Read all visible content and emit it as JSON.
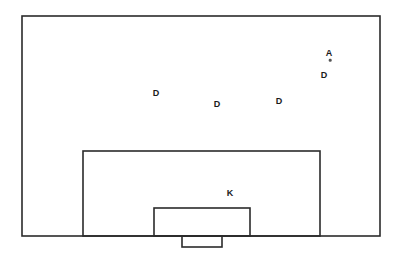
{
  "diagram": {
    "background_color": "#ffffff",
    "line_color": "#2b2b2b",
    "label_color": "#1a1a1a",
    "canvas": {
      "width": 399,
      "height": 256
    },
    "shapes": {
      "field_boundary": {
        "x": 22,
        "y": 16,
        "width": 358,
        "height": 220,
        "label": "field-boundary"
      },
      "penalty_area": {
        "x": 83,
        "y": 151,
        "width": 237,
        "height": 85,
        "label": "penalty-area"
      },
      "goal_area": {
        "x": 154,
        "y": 208,
        "width": 96,
        "height": 28,
        "label": "goal-area"
      },
      "goal_mouth": {
        "x": 182,
        "y": 236,
        "width": 40,
        "height": 11,
        "label": "goal-mouth"
      }
    },
    "markers": [
      {
        "id": "attacker-1",
        "label": "A",
        "role": "attacker",
        "x": 329,
        "y": 53
      },
      {
        "id": "defender-1",
        "label": "D",
        "role": "defender",
        "x": 324,
        "y": 75
      },
      {
        "id": "defender-2",
        "label": "D",
        "role": "defender",
        "x": 156,
        "y": 93
      },
      {
        "id": "defender-3",
        "label": "D",
        "role": "defender",
        "x": 217,
        "y": 104
      },
      {
        "id": "defender-4",
        "label": "D",
        "role": "defender",
        "x": 279,
        "y": 101
      },
      {
        "id": "keeper-1",
        "label": "K",
        "role": "goalkeeper",
        "x": 230,
        "y": 193
      }
    ],
    "ball": {
      "id": "ball",
      "x": 330,
      "y": 60,
      "color": "#555555"
    }
  }
}
